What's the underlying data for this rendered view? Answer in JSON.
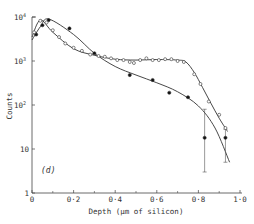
{
  "chart_data": {
    "type": "scatter",
    "title": "",
    "panel_label": "(d)",
    "xlabel": "Depth (μm of silicon)",
    "ylabel": "Counts",
    "xlim": [
      0,
      1.0
    ],
    "ylim": [
      1,
      10000
    ],
    "yscale": "log",
    "grid": false,
    "legend": null,
    "x_ticks": [
      {
        "value": 0,
        "label": "0"
      },
      {
        "value": 0.2,
        "label": "0·2"
      },
      {
        "value": 0.4,
        "label": "0·4"
      },
      {
        "value": 0.6,
        "label": "0·6"
      },
      {
        "value": 0.8,
        "label": "0·8"
      },
      {
        "value": 1.0,
        "label": "1·0"
      }
    ],
    "x_minor_ticks": [
      0.1,
      0.3,
      0.5,
      0.7,
      0.9
    ],
    "y_ticks": [
      {
        "value": 1,
        "label": "1",
        "sup": ""
      },
      {
        "value": 10,
        "label": "10",
        "sup": ""
      },
      {
        "value": 100,
        "label": "10",
        "sup": "2"
      },
      {
        "value": 1000,
        "label": "10",
        "sup": "3"
      },
      {
        "value": 10000,
        "label": "10",
        "sup": "4"
      }
    ],
    "series": [
      {
        "name": "filled circles",
        "marker": "filled-circle",
        "points": [
          {
            "x": 0.02,
            "y": 4000
          },
          {
            "x": 0.05,
            "y": 6500
          },
          {
            "x": 0.08,
            "y": 8500
          },
          {
            "x": 0.18,
            "y": 5500
          },
          {
            "x": 0.3,
            "y": 1500
          },
          {
            "x": 0.47,
            "y": 480
          },
          {
            "x": 0.58,
            "y": 370
          },
          {
            "x": 0.66,
            "y": 190
          },
          {
            "x": 0.75,
            "y": 150
          },
          {
            "x": 0.83,
            "y": 18,
            "err_low": 3,
            "err_high": 80
          },
          {
            "x": 0.93,
            "y": 18,
            "err_low": 5,
            "err_high": 28
          }
        ],
        "fit_curve": [
          [
            0.0,
            3000
          ],
          [
            0.04,
            6000
          ],
          [
            0.08,
            9000
          ],
          [
            0.2,
            4000
          ],
          [
            0.3,
            1500
          ],
          [
            0.4,
            750
          ],
          [
            0.5,
            480
          ],
          [
            0.6,
            320
          ],
          [
            0.7,
            200
          ],
          [
            0.8,
            95
          ],
          [
            0.88,
            30
          ],
          [
            0.95,
            5
          ]
        ]
      },
      {
        "name": "open circles",
        "marker": "open-circle",
        "points": [
          {
            "x": 0.01,
            "y": 4500
          },
          {
            "x": 0.04,
            "y": 8200
          },
          {
            "x": 0.07,
            "y": 7500
          },
          {
            "x": 0.1,
            "y": 5000
          },
          {
            "x": 0.13,
            "y": 3500
          },
          {
            "x": 0.16,
            "y": 2500
          },
          {
            "x": 0.2,
            "y": 2000
          },
          {
            "x": 0.24,
            "y": 1700
          },
          {
            "x": 0.28,
            "y": 1400
          },
          {
            "x": 0.32,
            "y": 1300
          },
          {
            "x": 0.35,
            "y": 1250
          },
          {
            "x": 0.38,
            "y": 1150
          },
          {
            "x": 0.41,
            "y": 1050
          },
          {
            "x": 0.44,
            "y": 1050
          },
          {
            "x": 0.47,
            "y": 950
          },
          {
            "x": 0.49,
            "y": 900
          },
          {
            "x": 0.52,
            "y": 1050
          },
          {
            "x": 0.55,
            "y": 1150
          },
          {
            "x": 0.58,
            "y": 1050
          },
          {
            "x": 0.61,
            "y": 1050
          },
          {
            "x": 0.64,
            "y": 1100
          },
          {
            "x": 0.67,
            "y": 1100
          },
          {
            "x": 0.7,
            "y": 1000
          },
          {
            "x": 0.73,
            "y": 950
          },
          {
            "x": 0.78,
            "y": 500
          },
          {
            "x": 0.81,
            "y": 300
          },
          {
            "x": 0.85,
            "y": 120
          },
          {
            "x": 0.9,
            "y": 60
          },
          {
            "x": 0.93,
            "y": 30
          }
        ],
        "fit_curve": [
          [
            0.0,
            3500
          ],
          [
            0.04,
            8500
          ],
          [
            0.1,
            4500
          ],
          [
            0.2,
            1900
          ],
          [
            0.3,
            1350
          ],
          [
            0.4,
            1100
          ],
          [
            0.5,
            1050
          ],
          [
            0.6,
            1080
          ],
          [
            0.7,
            1050
          ],
          [
            0.74,
            950
          ],
          [
            0.78,
            550
          ],
          [
            0.82,
            250
          ],
          [
            0.86,
            110
          ],
          [
            0.9,
            50
          ],
          [
            0.94,
            25
          ]
        ]
      }
    ]
  }
}
